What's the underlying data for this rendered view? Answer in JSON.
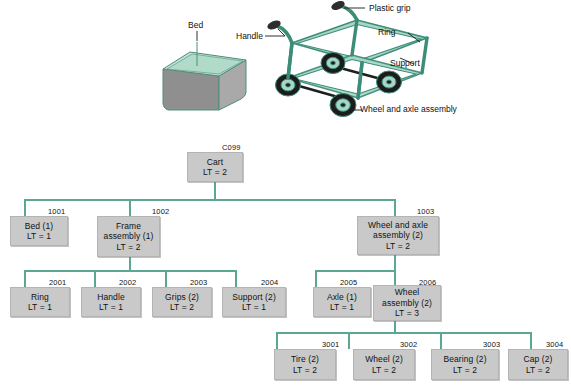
{
  "illustration": {
    "bed_label": "Bed",
    "handle_label": "Handle",
    "plastic_grip_label": "Plastic grip",
    "ring_label": "Ring",
    "support_label": "Support",
    "wheel_axle_label_line1": "Wheel and",
    "wheel_axle_label_line2": "axle assembly",
    "colors": {
      "frame_fill": "#9fd2c2",
      "frame_stroke": "#3c8d78",
      "bed_top": "#bfe0d4",
      "bed_front": "#8e8e8e",
      "bed_side": "#a8a8a8",
      "tire": "#1a1a1a",
      "hub": "#b9d9cc"
    }
  },
  "tree": {
    "line_color": "#5aa893",
    "box_fill": "#c9c9c9",
    "box_stroke": "#b4b4b4",
    "levels": [
      {
        "level": 0,
        "nodes": [
          {
            "code": "C099",
            "lines": [
              "Cart",
              "LT = 2"
            ]
          }
        ]
      },
      {
        "level": 1,
        "nodes": [
          {
            "code": "1001",
            "lines": [
              "Bed (1)",
              "LT = 1"
            ]
          },
          {
            "code": "1002",
            "lines": [
              "Frame",
              "assembly (1)",
              "LT = 2"
            ]
          },
          {
            "code": "1003",
            "lines": [
              "Wheel and axle",
              "assembly (2)",
              "LT = 2"
            ]
          }
        ]
      },
      {
        "level": 2,
        "nodes": [
          {
            "code": "2001",
            "lines": [
              "Ring",
              "LT = 1"
            ]
          },
          {
            "code": "2002",
            "lines": [
              "Handle",
              "LT = 1"
            ]
          },
          {
            "code": "2003",
            "lines": [
              "Grips (2)",
              "LT = 2"
            ]
          },
          {
            "code": "2004",
            "lines": [
              "Support (2)",
              "LT = 1"
            ]
          },
          {
            "code": "2005",
            "lines": [
              "Axle (1)",
              "LT = 1"
            ]
          },
          {
            "code": "2006",
            "lines": [
              "Wheel",
              "assembly (2)",
              "LT = 3"
            ]
          }
        ]
      },
      {
        "level": 3,
        "nodes": [
          {
            "code": "3001",
            "lines": [
              "Tire (2)",
              "LT = 2"
            ]
          },
          {
            "code": "3002",
            "lines": [
              "Wheel (2)",
              "LT = 2"
            ]
          },
          {
            "code": "3003",
            "lines": [
              "Bearing (2)",
              "LT = 2"
            ]
          },
          {
            "code": "3004",
            "lines": [
              "Cap (2)",
              "LT = 2"
            ]
          }
        ]
      }
    ]
  }
}
